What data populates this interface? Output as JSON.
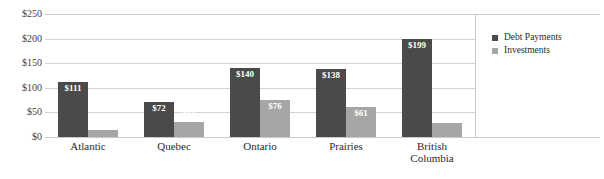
{
  "chart_data": {
    "type": "bar",
    "title": "",
    "subtitle": "",
    "xlabel": "",
    "ylabel": "",
    "ylim": [
      0,
      250
    ],
    "yticks": [
      0,
      50,
      100,
      150,
      200,
      250
    ],
    "ytick_labels": [
      "$0",
      "$50",
      "$100",
      "$150",
      "$200",
      "$250"
    ],
    "grid": true,
    "legend_position": "right",
    "categories": [
      "Atlantic",
      "Quebec",
      "Ontario",
      "Prairies",
      "British Columbia"
    ],
    "category_label_lines": [
      [
        "Atlantic"
      ],
      [
        "Quebec"
      ],
      [
        "Ontario"
      ],
      [
        "Prairies"
      ],
      [
        "British",
        "Columbia"
      ]
    ],
    "series": [
      {
        "name": "Debt Payments",
        "color": "#4a4a4a",
        "values": [
          111,
          72,
          140,
          138,
          199
        ],
        "data_labels": [
          "$111",
          "$72",
          "$140",
          "$138",
          "$199"
        ],
        "label_position": "inside"
      },
      {
        "name": "Investments",
        "color": "#a6a6a6",
        "values": [
          15,
          30,
          76,
          61,
          28
        ],
        "data_labels": [
          "$15",
          "$30",
          "$76",
          "$61",
          "$28"
        ],
        "label_position": "outside-above"
      }
    ]
  },
  "legend": {
    "items": [
      {
        "label": "Debt Payments",
        "color": "#4a4a4a",
        "marker": "square-marker"
      },
      {
        "label": "Investments",
        "color": "#a6a6a6",
        "marker": "square-marker"
      }
    ]
  },
  "colors": {
    "debt_payments": "#4a4a4a",
    "investments": "#a6a6a6",
    "gridline": "#d3d3d3",
    "axis_rule": "#c9c9c9",
    "text": "#2b2b2b",
    "data_label_text": "#ffffff",
    "background": "#ffffff"
  }
}
